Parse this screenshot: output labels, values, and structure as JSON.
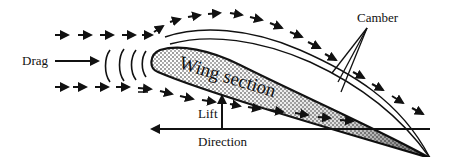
{
  "diagram": {
    "labels": {
      "drag": "Drag",
      "camber": "Camber",
      "wing_section": "Wing section",
      "lift": "Lift",
      "direction": "Direction"
    },
    "colors": {
      "ink": "#111111",
      "background": "#ffffff",
      "stipple": "#222222"
    },
    "elements": [
      {
        "name": "upper-airflow-arrows",
        "description": "dashed arrows flowing over top of the wing"
      },
      {
        "name": "lower-airflow-arrows",
        "description": "dashed arrows flowing under the wing"
      },
      {
        "name": "pressure-wave-arcs",
        "count": 4
      },
      {
        "name": "camber-lines",
        "count": 3
      },
      {
        "name": "drag-arrow",
        "direction": "right"
      },
      {
        "name": "lift-arrow",
        "direction": "up"
      },
      {
        "name": "direction-arrow",
        "direction": "left"
      }
    ]
  }
}
